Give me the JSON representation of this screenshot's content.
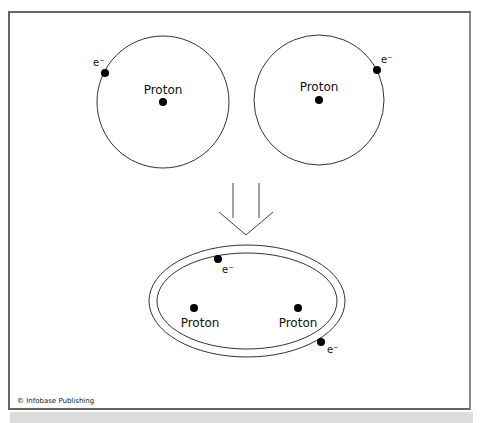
{
  "diagram": {
    "atoms_before": [
      {
        "nucleus_label": "Proton",
        "electron_label": "e⁻"
      },
      {
        "nucleus_label": "Proton",
        "electron_label": "e⁻"
      }
    ],
    "arrow": {
      "direction": "down"
    },
    "molecule_after": {
      "nuclei": [
        {
          "label": "Proton"
        },
        {
          "label": "Proton"
        }
      ],
      "electrons": [
        {
          "label": "e⁻"
        },
        {
          "label": "e⁻"
        }
      ]
    },
    "credit": "© Infobase Publishing"
  }
}
